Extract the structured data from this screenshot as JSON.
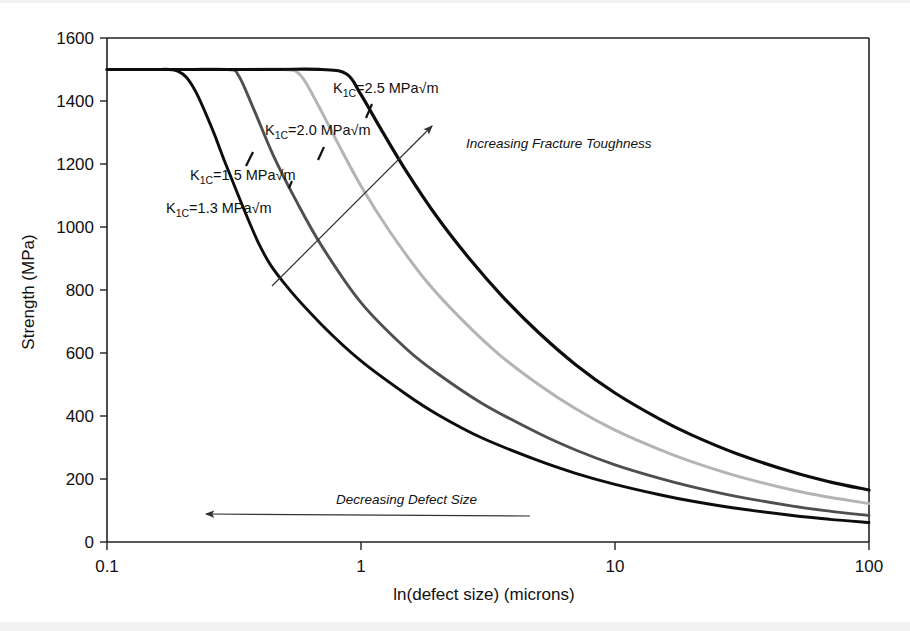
{
  "chart_data": {
    "type": "line",
    "title": "",
    "xlabel": "ln(defect size) (microns)",
    "ylabel": "Strength (MPa)",
    "xscale": "log",
    "xlim": [
      0.1,
      100
    ],
    "ylim": [
      0,
      1600
    ],
    "xticks": [
      "0.1",
      "1",
      "10",
      "100"
    ],
    "xtick_values": [
      0.1,
      1,
      10,
      100
    ],
    "yticks": [
      "0",
      "200",
      "400",
      "600",
      "800",
      "1000",
      "1200",
      "1400",
      "1600"
    ],
    "ytick_values": [
      0,
      200,
      400,
      600,
      800,
      1000,
      1200,
      1400,
      1600
    ],
    "grid": false,
    "legend": "inline-labels",
    "plateau_strength": 1500,
    "series": [
      {
        "name": "K1C=1.3 MPa√m",
        "label_prefix": "K",
        "label_sub": "1C",
        "label_suffix": "=1.3 MPa√m",
        "toughness": 1.3,
        "color": "#0d0d0d",
        "width": 2.9,
        "knee_x": 0.19,
        "x": [
          0.1,
          0.15,
          0.19,
          0.22,
          0.26,
          0.3,
          0.4,
          0.5,
          0.7,
          1,
          1.5,
          2,
          3,
          5,
          7,
          10,
          15,
          20,
          30,
          50,
          70,
          100
        ],
        "y": [
          1500,
          1500,
          1495,
          1440,
          1310,
          1180,
          940,
          820,
          690,
          575,
          470,
          405,
          330,
          258,
          218,
          183,
          150,
          130,
          107,
          84,
          72,
          62
        ]
      },
      {
        "name": "K1C=1.5 MPa√m",
        "label_prefix": "K",
        "label_sub": "1C",
        "label_suffix": "=1.5 MPa√m",
        "toughness": 1.5,
        "color": "#4f4f4f",
        "width": 2.9,
        "knee_x": 0.33,
        "x": [
          0.1,
          0.2,
          0.3,
          0.33,
          0.38,
          0.45,
          0.55,
          0.7,
          1,
          1.5,
          2,
          3,
          5,
          7,
          10,
          15,
          20,
          30,
          50,
          70,
          100
        ],
        "y": [
          1500,
          1500,
          1500,
          1480,
          1370,
          1230,
          1090,
          940,
          760,
          615,
          535,
          440,
          345,
          292,
          245,
          202,
          176,
          145,
          114,
          98,
          84
        ]
      },
      {
        "name": "K1C=2.0 MPa√m",
        "label_prefix": "K",
        "label_sub": "1C",
        "label_suffix": "=2.0 MPa√m",
        "toughness": 2.0,
        "color": "#b4b4b4",
        "width": 3.0,
        "knee_x": 0.58,
        "x": [
          0.1,
          0.3,
          0.5,
          0.58,
          0.68,
          0.8,
          1,
          1.3,
          1.8,
          2.5,
          3.5,
          5,
          7,
          10,
          15,
          20,
          30,
          50,
          70,
          100
        ],
        "y": [
          1500,
          1500,
          1500,
          1480,
          1385,
          1275,
          1130,
          985,
          830,
          705,
          595,
          500,
          423,
          355,
          293,
          255,
          210,
          165,
          142,
          122
        ]
      },
      {
        "name": "K1C=2.5 MPa√m",
        "label_prefix": "K",
        "label_sub": "1C",
        "label_suffix": "=2.5 MPa√m",
        "toughness": 2.5,
        "color": "#0d0d0d",
        "width": 3.2,
        "knee_x": 0.88,
        "x": [
          0.1,
          0.4,
          0.7,
          0.88,
          1.0,
          1.2,
          1.5,
          2,
          2.7,
          3.6,
          5,
          7,
          10,
          15,
          20,
          30,
          50,
          70,
          100
        ],
        "y": [
          1500,
          1500,
          1500,
          1485,
          1420,
          1310,
          1180,
          1030,
          895,
          780,
          665,
          563,
          473,
          390,
          340,
          281,
          222,
          191,
          165
        ]
      }
    ],
    "annotations": [
      {
        "name": "increasing-fracture-toughness",
        "text": "Increasing Fracture Toughness",
        "style": "italic",
        "arrow": "up-right"
      },
      {
        "name": "decreasing-defect-size",
        "text": "Decreasing Defect Size",
        "style": "italic",
        "arrow": "left"
      }
    ]
  },
  "axes": {
    "x_label": "ln(defect size) (microns)",
    "y_label": "Strength (MPa)"
  }
}
